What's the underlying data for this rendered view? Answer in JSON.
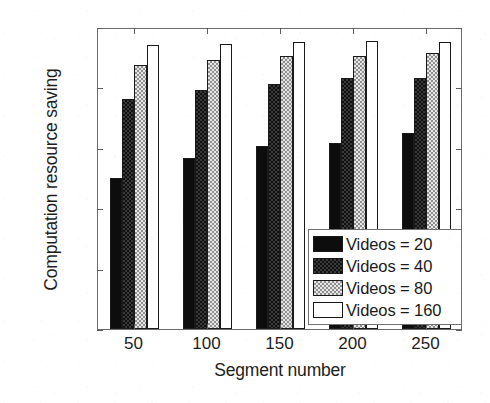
{
  "chart_data": {
    "type": "bar",
    "title": "",
    "xlabel": "Segment number",
    "ylabel": "Computation resource saving",
    "categories": [
      "50",
      "100",
      "150",
      "200",
      "250"
    ],
    "xtick_labels": [
      "50",
      "100",
      "150",
      "200",
      "250"
    ],
    "ytick_labels": [
      "0",
      "0.2",
      "0.4",
      "0.6",
      "0.8",
      "1"
    ],
    "ytick_values": [
      0,
      0.2,
      0.4,
      0.6,
      0.8,
      1
    ],
    "ylim": [
      0,
      1
    ],
    "grid": false,
    "legend_position": "lower right",
    "series": [
      {
        "name": "Videos = 20",
        "fill": "solid-black",
        "color": "#0d0d0d",
        "values": [
          0.5,
          0.565,
          0.605,
          0.615,
          0.65
        ]
      },
      {
        "name": "Videos = 40",
        "fill": "dark-checker",
        "color": "#3a3a3a",
        "values": [
          0.76,
          0.79,
          0.81,
          0.83,
          0.83
        ]
      },
      {
        "name": "Videos = 80",
        "fill": "light-stipple",
        "color": "#e6e6e6",
        "values": [
          0.875,
          0.89,
          0.905,
          0.905,
          0.915
        ]
      },
      {
        "name": "Videos = 160",
        "fill": "white",
        "color": "#ffffff",
        "values": [
          0.94,
          0.945,
          0.95,
          0.955,
          0.95
        ]
      }
    ]
  },
  "legend": {
    "items": [
      {
        "label": "Videos = 20"
      },
      {
        "label": "Videos = 40"
      },
      {
        "label": "Videos = 80"
      },
      {
        "label": "Videos = 160"
      }
    ]
  },
  "axes": {
    "x_title": "Segment number",
    "y_title": "Computation resource saving"
  }
}
